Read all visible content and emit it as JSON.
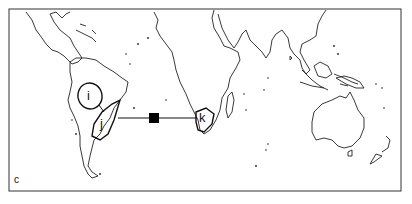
{
  "panel_label": "c",
  "regions": [
    {
      "id": "i",
      "label": "i"
    },
    {
      "id": "j",
      "label": "j"
    },
    {
      "id": "k",
      "label": "k"
    }
  ],
  "connector": {
    "from": "j",
    "to": "k",
    "marker": "filled-square"
  },
  "colors": {
    "line": "#111111",
    "background": "#ffffff"
  }
}
